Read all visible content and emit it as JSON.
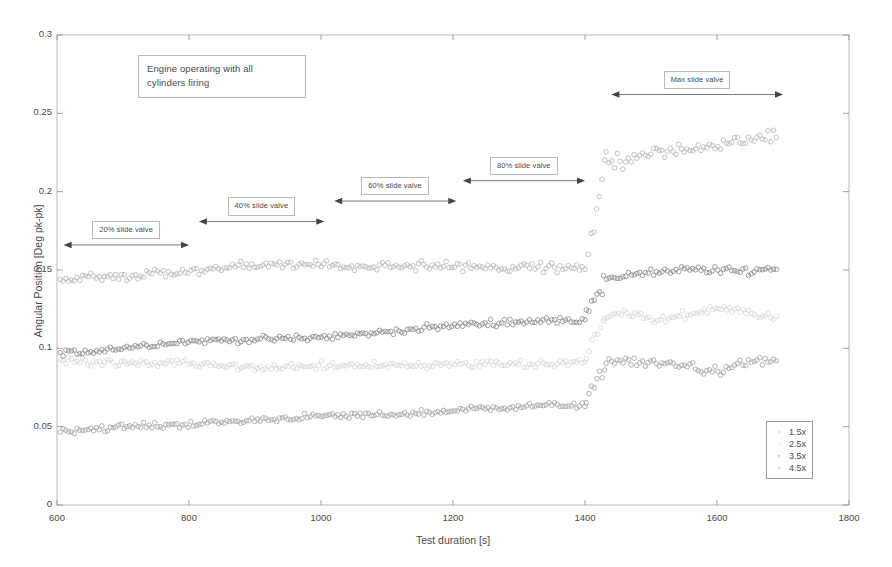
{
  "chart_data": {
    "type": "scatter",
    "title": "",
    "xlabel": "Test duration [s]",
    "ylabel": "Angular Position [Deg pk-pk]",
    "xlim": [
      600,
      1800
    ],
    "ylim": [
      0,
      0.3
    ],
    "xticks": [
      600,
      800,
      1000,
      1200,
      1400,
      1600,
      1800
    ],
    "yticks": [
      0,
      0.05,
      0.1,
      0.15,
      0.2,
      0.25,
      0.3
    ],
    "xtick_labels": [
      "600",
      "800",
      "1000",
      "1200",
      "1400",
      "1600",
      "1800"
    ],
    "ytick_labels": [
      "0",
      "0.05",
      "0.1",
      "0.15",
      "0.2",
      "0.25",
      "0.3"
    ],
    "grid": false,
    "marker": "open-circle",
    "legend_position": "lower-right",
    "legend_entries": [
      "1.5x",
      "2.5x",
      "3.5x",
      "4.5x"
    ],
    "series": [
      {
        "name": "1.5x",
        "color": "#b9b9b9",
        "segments": [
          {
            "x_start": 605,
            "x_end": 1400,
            "y_start": 0.142,
            "y_end": 0.157,
            "noise": 0.006
          },
          {
            "x_start": 1405,
            "x_end": 1430,
            "y_start": 0.162,
            "y_end": 0.215,
            "noise": 0.008
          },
          {
            "x_start": 1432,
            "x_end": 1690,
            "y_start": 0.228,
            "y_end": 0.232,
            "noise": 0.009
          }
        ]
      },
      {
        "name": "2.5x",
        "color": "#d8d8d8",
        "segments": [
          {
            "x_start": 605,
            "x_end": 1400,
            "y_start": 0.09,
            "y_end": 0.094,
            "noise": 0.005
          },
          {
            "x_start": 1402,
            "x_end": 1428,
            "y_start": 0.096,
            "y_end": 0.115,
            "noise": 0.006
          },
          {
            "x_start": 1430,
            "x_end": 1690,
            "y_start": 0.12,
            "y_end": 0.122,
            "noise": 0.006
          }
        ]
      },
      {
        "name": "3.5x",
        "color": "#8d8d8d",
        "segments": [
          {
            "x_start": 605,
            "x_end": 1400,
            "y_start": 0.099,
            "y_end": 0.118,
            "noise": 0.004
          },
          {
            "x_start": 1402,
            "x_end": 1426,
            "y_start": 0.122,
            "y_end": 0.14,
            "noise": 0.006
          },
          {
            "x_start": 1428,
            "x_end": 1690,
            "y_start": 0.15,
            "y_end": 0.149,
            "noise": 0.005
          }
        ]
      },
      {
        "name": "4.5x",
        "color": "#a5a5a5",
        "segments": [
          {
            "x_start": 605,
            "x_end": 1400,
            "y_start": 0.047,
            "y_end": 0.064,
            "noise": 0.004
          },
          {
            "x_start": 1402,
            "x_end": 1430,
            "y_start": 0.066,
            "y_end": 0.085,
            "noise": 0.005
          },
          {
            "x_start": 1432,
            "x_end": 1690,
            "y_start": 0.092,
            "y_end": 0.092,
            "noise": 0.006
          }
        ]
      }
    ],
    "annotations": [
      {
        "id": "engine-note",
        "text": "Engine operating with all cylinders firing",
        "kind": "note"
      },
      {
        "id": "span-20",
        "text": "20% slide valve",
        "kind": "span",
        "x_start": 610,
        "x_end": 800,
        "y": 0.166
      },
      {
        "id": "span-40",
        "text": "40% slide valve",
        "kind": "span",
        "x_start": 815,
        "x_end": 1005,
        "y": 0.181
      },
      {
        "id": "span-60",
        "text": "60% slide valve",
        "kind": "span",
        "x_start": 1020,
        "x_end": 1205,
        "y": 0.194
      },
      {
        "id": "span-80",
        "text": "80% slide valve",
        "kind": "span",
        "x_start": 1215,
        "x_end": 1400,
        "y": 0.207
      },
      {
        "id": "span-max",
        "text": "Max slide valve",
        "kind": "span",
        "x_start": 1440,
        "x_end": 1700,
        "y": 0.262
      }
    ]
  },
  "legend": {
    "title": "",
    "items": [
      {
        "label": "1.5x",
        "marker": "open-circle",
        "color": "#b9b9b9"
      },
      {
        "label": "2.5x",
        "marker": "open-circle",
        "color": "#d8d8d8"
      },
      {
        "label": "3.5x",
        "marker": "open-circle",
        "color": "#8d8d8d"
      },
      {
        "label": "4.5x",
        "marker": "open-circle",
        "color": "#a5a5a5"
      }
    ]
  },
  "notes": {
    "engine_note_line1": "Engine operating with all",
    "engine_note_line2": "cylinders firing"
  },
  "colors": {
    "axis": "#8a8a8a",
    "text": "#4b4b4b",
    "box_border": "#b9b9b9",
    "background": "#ffffff"
  }
}
